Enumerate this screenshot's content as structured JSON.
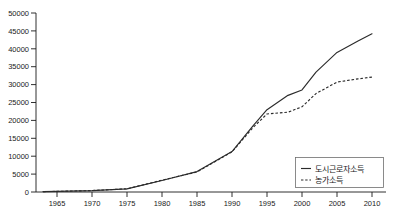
{
  "chart_data": {
    "type": "line",
    "title": "",
    "subtitle": "",
    "xlabel": "",
    "ylabel": "",
    "xlim": [
      1962,
      2012
    ],
    "ylim": [
      0,
      50000
    ],
    "grid": false,
    "legend_position": "bottom-right",
    "x_ticks": [
      "1965",
      "1970",
      "1975",
      "1980",
      "1985",
      "1990",
      "1995",
      "2000",
      "2005",
      "2010"
    ],
    "y_ticks": [
      "0",
      "5000",
      "10000",
      "15000",
      "20000",
      "25000",
      "30000",
      "35000",
      "40000",
      "45000",
      "50000"
    ],
    "x": [
      1963,
      1965,
      1970,
      1975,
      1980,
      1985,
      1990,
      1993,
      1995,
      1998,
      2000,
      2002,
      2005,
      2008,
      2010
    ],
    "series": [
      {
        "name": "도시근로자소득",
        "style": "solid",
        "color": "#2b2b2b",
        "values": [
          120,
          180,
          380,
          860,
          3200,
          5700,
          11300,
          18500,
          23000,
          27000,
          28500,
          33500,
          39000,
          42200,
          44200
        ]
      },
      {
        "name": "농가소득",
        "style": "dashed",
        "color": "#2b2b2b",
        "values": [
          110,
          170,
          400,
          900,
          3300,
          5600,
          11200,
          18000,
          21800,
          22300,
          23800,
          27500,
          30700,
          31600,
          32100
        ]
      }
    ],
    "annotations": []
  },
  "legend": {
    "entries": [
      {
        "label": "도시근로자소득",
        "style": "solid"
      },
      {
        "label": "농가소득",
        "style": "dashed"
      }
    ]
  },
  "corner_artifact": {
    "text": ""
  }
}
